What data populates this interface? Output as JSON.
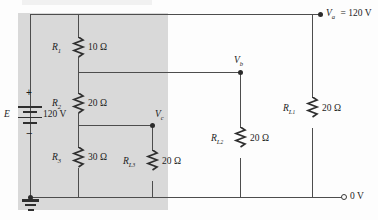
{
  "figure": {
    "shaded_region_label": "supply-network-shading"
  },
  "source": {
    "symbol": "E",
    "value": "120 V",
    "plus": "+",
    "minus": "−",
    "ground_name": "earth-ground"
  },
  "series_resistors": [
    {
      "name": "R",
      "sub": "1",
      "value": "10 Ω"
    },
    {
      "name": "R",
      "sub": "2",
      "value": "20 Ω"
    },
    {
      "name": "R",
      "sub": "3",
      "value": "30 Ω"
    }
  ],
  "load_resistors": [
    {
      "name": "R",
      "sub": "L",
      "sub2": "1",
      "value": "20 Ω"
    },
    {
      "name": "R",
      "sub": "L",
      "sub2": "2",
      "value": "20 Ω"
    },
    {
      "name": "R",
      "sub": "L",
      "sub2": "3",
      "value": "20 Ω"
    }
  ],
  "nodes": [
    {
      "name": "V",
      "sub": "a",
      "value": "= 120 V"
    },
    {
      "name": "V",
      "sub": "b",
      "value": ""
    },
    {
      "name": "V",
      "sub": "c",
      "value": ""
    }
  ],
  "terminals": [
    {
      "label": "0 V"
    }
  ],
  "colors": {
    "wire": "#4d4d4d",
    "ink": "#1c1c1c",
    "shade": "#d9d9d9",
    "background": "#fdfdfd"
  }
}
